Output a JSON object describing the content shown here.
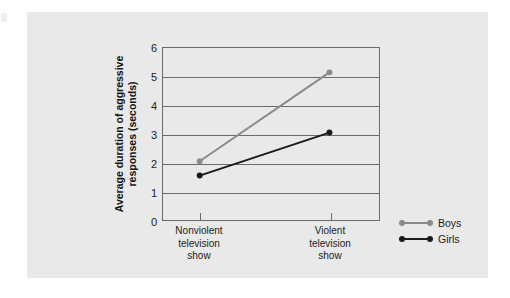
{
  "figure": {
    "background_color": "#e9e9e9",
    "page_color": "#ffffff"
  },
  "chart_data": {
    "type": "line",
    "title": "",
    "xlabel": "",
    "ylabel": "Average duration of aggressive responses (seconds)",
    "ylabel_line1": "Average duration of",
    "ylabel_line2": "aggressive responses (seconds)",
    "categories": [
      "Nonviolent television show",
      "Violent television show"
    ],
    "category_lines": [
      [
        "Nonviolent",
        "television",
        "show"
      ],
      [
        "Violent",
        "television",
        "show"
      ]
    ],
    "ylim": [
      0,
      6
    ],
    "ytick_labels": [
      "0",
      "1",
      "2",
      "3",
      "4",
      "5",
      "6"
    ],
    "ytick_values": [
      0,
      1,
      2,
      3,
      4,
      5,
      6
    ],
    "grid": true,
    "legend_position": "right",
    "series": [
      {
        "name": "Boys",
        "color": "#8a8a8a",
        "values": [
          2.05,
          5.15
        ]
      },
      {
        "name": "Girls",
        "color": "#1a1a1a",
        "values": [
          1.55,
          3.05
        ]
      }
    ]
  },
  "legend": {
    "items": [
      {
        "label": "Boys",
        "color": "#8a8a8a"
      },
      {
        "label": "Girls",
        "color": "#1a1a1a"
      }
    ]
  }
}
